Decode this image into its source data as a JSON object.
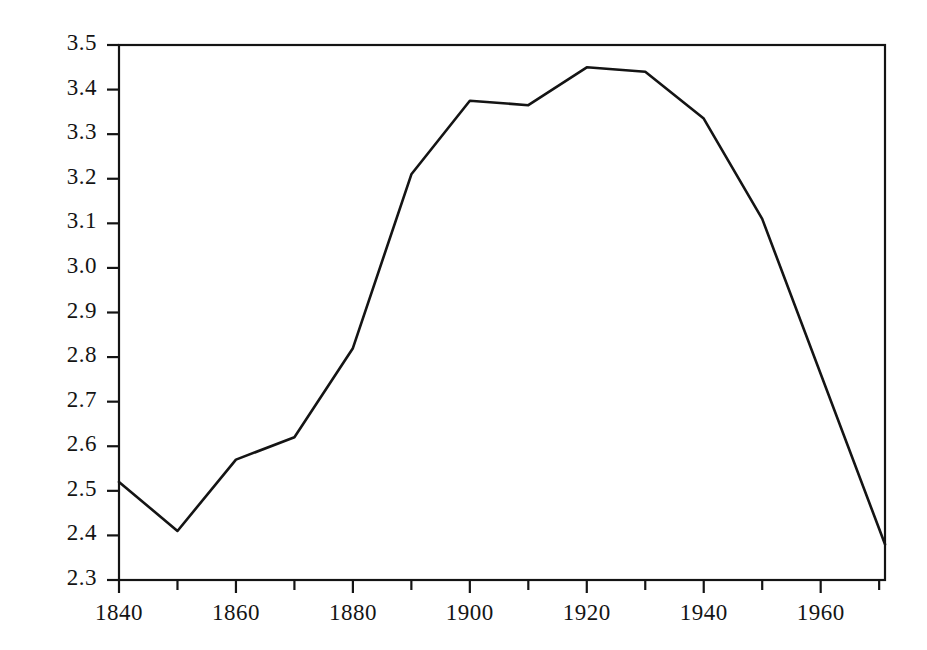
{
  "chart_data": {
    "type": "line",
    "title": "",
    "xlabel": "",
    "ylabel": "",
    "xlim": [
      1840,
      1971
    ],
    "ylim": [
      2.3,
      3.5
    ],
    "grid": false,
    "legend": null,
    "line_color": "#141414",
    "background_color": "#ffffff",
    "axis_color": "#141414",
    "x": [
      1840,
      1850,
      1860,
      1870,
      1880,
      1890,
      1900,
      1910,
      1920,
      1930,
      1940,
      1950,
      1971
    ],
    "values": [
      2.52,
      2.41,
      2.57,
      2.62,
      2.82,
      3.21,
      3.375,
      3.365,
      3.45,
      3.44,
      3.335,
      3.11,
      2.38
    ],
    "series": [
      {
        "name": "series-1",
        "values": [
          2.52,
          2.41,
          2.57,
          2.62,
          2.82,
          3.21,
          3.375,
          3.365,
          3.45,
          3.44,
          3.335,
          3.11,
          2.38
        ]
      }
    ],
    "y_ticks": [
      2.3,
      2.4,
      2.5,
      2.6,
      2.7,
      2.8,
      2.9,
      3.0,
      3.1,
      3.2,
      3.3,
      3.4,
      3.5
    ],
    "y_tick_labels": [
      "2.3",
      "2.4",
      "2.5",
      "2.6",
      "2.7",
      "2.8",
      "2.9",
      "3.0",
      "3.1",
      "3.2",
      "3.3",
      "3.4",
      "3.5"
    ],
    "x_ticks": [
      1840,
      1850,
      1860,
      1870,
      1880,
      1890,
      1900,
      1910,
      1920,
      1930,
      1940,
      1950,
      1960,
      1970
    ],
    "x_tick_labels_major": [
      "1840",
      "1860",
      "1880",
      "1900",
      "1920",
      "1940",
      "1960"
    ],
    "x_major_ticks": [
      1840,
      1860,
      1880,
      1900,
      1920,
      1940,
      1960
    ]
  }
}
